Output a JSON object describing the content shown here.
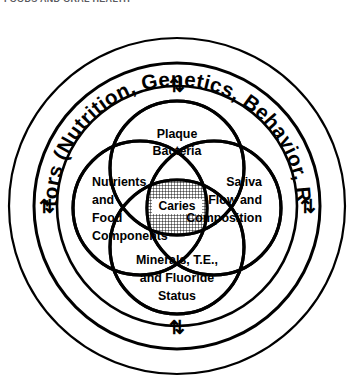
{
  "header": {
    "running_head": "FOODS AND ORAL HEALTH"
  },
  "figure": {
    "name": "caries-venn-diagram",
    "outer_ring_text": "Host Factors (Nutrition, Genetics, Behavior, Race, Age)",
    "center_label": "Caries",
    "arrows": [
      {
        "name": "arrow-top",
        "glyph": "⇅"
      },
      {
        "name": "arrow-right",
        "glyph": "⇅"
      },
      {
        "name": "arrow-bottom",
        "glyph": "⇅"
      },
      {
        "name": "arrow-left",
        "glyph": "⇅"
      }
    ],
    "circles": [
      {
        "name": "plaque-bacteria",
        "lines": [
          "Plaque",
          "Bacteria"
        ]
      },
      {
        "name": "nutrients-and-food-components",
        "lines": [
          "Nutrients",
          "and",
          "Food",
          "Components"
        ]
      },
      {
        "name": "saliva-flow-and-composition",
        "lines": [
          "Saliva",
          "Flow and",
          "Composition"
        ]
      },
      {
        "name": "minerals-te-and-fluoride-status",
        "lines": [
          "Minerals, T.E.,",
          "and Fluoride",
          "Status"
        ]
      }
    ],
    "colors": {
      "stroke": "#000000",
      "background": "#ffffff",
      "hatch": "#000000"
    }
  }
}
